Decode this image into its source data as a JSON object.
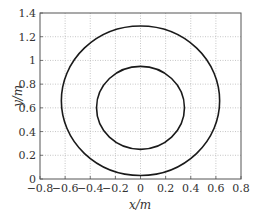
{
  "chart_data": {
    "type": "line",
    "title": "",
    "xlabel": "x/m",
    "ylabel": "y/m",
    "xlim": [
      -0.8,
      0.8
    ],
    "ylim": [
      0,
      1.4
    ],
    "xticks": [
      "-0.8",
      "-0.6",
      "-0.4",
      "-0.2",
      "0",
      "0.2",
      "0.4",
      "0.6",
      "0.8"
    ],
    "yticks": [
      "0",
      "0.2",
      "0.4",
      "0.6",
      "0.8",
      "1",
      "1.2",
      "1.4"
    ],
    "grid": true,
    "legend": null,
    "series": [
      {
        "name": "outer circle",
        "shape": "circle",
        "center": [
          0,
          0.66
        ],
        "radius": 0.63,
        "color": "#1a1a1a"
      },
      {
        "name": "inner circle",
        "shape": "circle",
        "center": [
          0,
          0.6
        ],
        "radius": 0.35,
        "color": "#1a1a1a"
      }
    ]
  }
}
